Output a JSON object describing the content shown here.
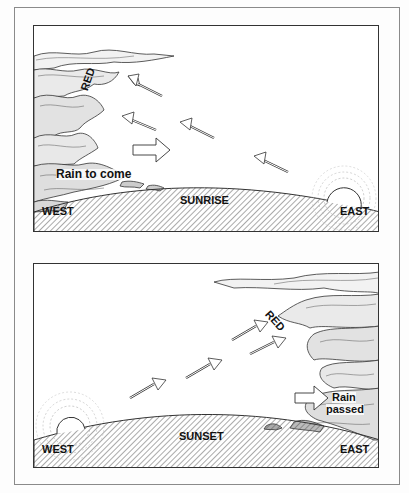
{
  "panels": [
    {
      "id": "sunrise",
      "title": "SUNRISE",
      "west_label": "WEST",
      "east_label": "EAST",
      "sky_label": "RED",
      "rain_label": "Rain to come",
      "sun_position": "east",
      "cloud_position": "west"
    },
    {
      "id": "sunset",
      "title": "SUNSET",
      "west_label": "WEST",
      "east_label": "EAST",
      "sky_label": "RED",
      "rain_label_line1": "Rain",
      "rain_label_line2": "passed",
      "sun_position": "west",
      "cloud_position": "east"
    }
  ],
  "colors": {
    "ink": "#222222",
    "ground_hatch": "#555555",
    "background": "#ffffff",
    "frame": "#8a8a8a"
  }
}
